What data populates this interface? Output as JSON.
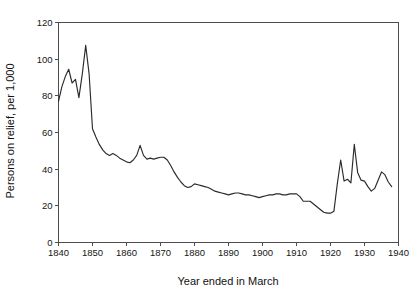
{
  "artifacts": {
    "top_left_smudge": "",
    "top_right_smudge": ""
  },
  "chart_data": {
    "type": "line",
    "title": "",
    "subtitle": "",
    "xlabel": "Year ended in March",
    "ylabel": "Persons on relief, per 1,000",
    "xlim": [
      1840,
      1940
    ],
    "ylim": [
      0,
      120
    ],
    "xticks": [
      1840,
      1850,
      1860,
      1870,
      1880,
      1890,
      1900,
      1910,
      1920,
      1930,
      1940
    ],
    "xtick_labels": [
      "1840",
      "1850",
      "1860",
      "1870",
      "1880",
      "1890",
      "1900",
      "1910",
      "1920",
      "1930",
      "1940"
    ],
    "yticks": [
      0,
      20,
      40,
      60,
      80,
      100,
      120
    ],
    "ytick_labels": [
      "0",
      "20",
      "40",
      "60",
      "80",
      "100",
      "120"
    ],
    "grid": false,
    "legend": null,
    "line_color": "#2b2b2b",
    "series": [
      {
        "name": "Persons on relief per 1,000",
        "x": [
          1840,
          1841,
          1842,
          1843,
          1844,
          1845,
          1846,
          1847,
          1848,
          1849,
          1850,
          1851,
          1852,
          1853,
          1854,
          1855,
          1856,
          1857,
          1858,
          1859,
          1860,
          1861,
          1862,
          1863,
          1864,
          1865,
          1866,
          1867,
          1868,
          1869,
          1870,
          1871,
          1872,
          1873,
          1874,
          1875,
          1876,
          1877,
          1878,
          1879,
          1880,
          1881,
          1882,
          1883,
          1884,
          1885,
          1886,
          1887,
          1888,
          1889,
          1890,
          1891,
          1892,
          1893,
          1894,
          1895,
          1896,
          1897,
          1898,
          1899,
          1900,
          1901,
          1902,
          1903,
          1904,
          1905,
          1906,
          1907,
          1908,
          1909,
          1910,
          1911,
          1912,
          1913,
          1914,
          1915,
          1916,
          1917,
          1918,
          1919,
          1920,
          1921,
          1922,
          1923,
          1924,
          1925,
          1926,
          1927,
          1928,
          1929,
          1930,
          1931,
          1932,
          1933,
          1934,
          1935,
          1936,
          1937,
          1938
        ],
        "y": [
          77.0,
          85.0,
          90.5,
          94.5,
          87.0,
          89.0,
          79.0,
          92.0,
          107.5,
          92.0,
          62.0,
          57.5,
          53.5,
          50.5,
          48.5,
          47.5,
          48.5,
          47.5,
          46.0,
          45.0,
          44.0,
          43.5,
          45.0,
          47.5,
          53.0,
          47.5,
          45.5,
          46.0,
          45.5,
          46.0,
          46.5,
          46.5,
          45.0,
          42.0,
          38.5,
          35.5,
          33.0,
          31.0,
          30.0,
          30.5,
          32.0,
          31.5,
          31.0,
          30.5,
          30.0,
          29.0,
          28.0,
          27.5,
          27.0,
          26.5,
          26.0,
          26.5,
          27.0,
          27.0,
          26.5,
          26.0,
          26.0,
          25.5,
          25.0,
          24.5,
          25.0,
          25.5,
          26.0,
          26.0,
          26.5,
          26.5,
          26.0,
          26.0,
          26.5,
          26.5,
          26.5,
          25.0,
          22.5,
          22.5,
          22.5,
          21.0,
          19.5,
          18.0,
          16.5,
          16.0,
          16.0,
          17.0,
          32.0,
          45.0,
          33.5,
          34.5,
          32.5,
          53.5,
          38.0,
          34.0,
          33.5,
          30.5,
          28.0,
          29.5,
          34.0,
          38.5,
          37.0,
          33.0,
          30.5
        ]
      }
    ],
    "annotations": []
  }
}
